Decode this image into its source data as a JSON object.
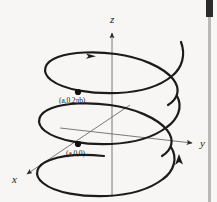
{
  "figure": {
    "background_color": "#f7f6f4",
    "curve_color": "#1b1b1b",
    "axis_color": "#6b6b6b",
    "axes": {
      "z_label": "z",
      "y_label": "y",
      "x_label": "x"
    },
    "points": [
      {
        "label": "(a,0,2πb)",
        "name": "upper-helix-point"
      },
      {
        "label": "(a,0,0)",
        "name": "lower-helix-point"
      }
    ],
    "labels": {
      "z": "z",
      "y": "y",
      "x": "x",
      "upper_point": "(a,0,2πb)",
      "lower_point": "(a,0,0)"
    }
  },
  "scrollbar": {
    "position": "right",
    "thumb_color": "#2b2b2b",
    "track_color": "#b9b9b9"
  }
}
